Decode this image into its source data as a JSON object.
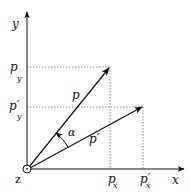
{
  "diagram": {
    "colors": {
      "line": "#111111",
      "dashed": "#555555",
      "background": "#ffffff"
    },
    "axes": {
      "x_label": "x",
      "y_label": "y",
      "origin_label": "z"
    },
    "vectors": [
      {
        "name": "p",
        "label": "p"
      },
      {
        "name": "p_prime",
        "label": "p′"
      }
    ],
    "angle_label": "α",
    "ticks": {
      "x": [
        {
          "main": "p",
          "sub": "x"
        },
        {
          "main": "p′",
          "sub": "x"
        }
      ],
      "y": [
        {
          "main": "p",
          "sub": "y"
        },
        {
          "main": "p′",
          "sub": "y"
        }
      ]
    }
  }
}
